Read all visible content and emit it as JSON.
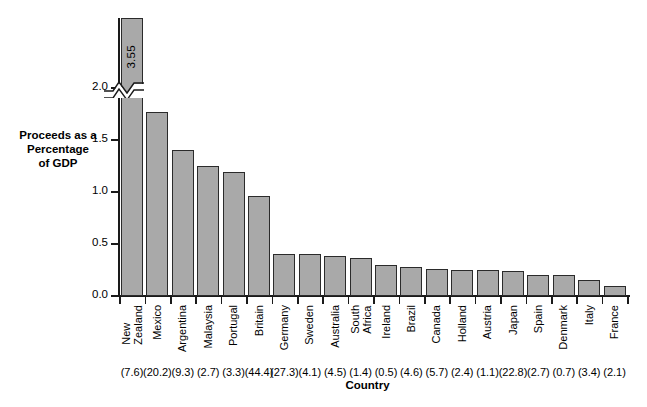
{
  "chart_data": {
    "type": "bar",
    "title": "",
    "xlabel": "Country",
    "ylabel": "Proceeds as a Percentage of GDP",
    "ylabel_lines": [
      "Proceeds as a",
      "Percentage",
      "of GDP"
    ],
    "ylim": [
      0.0,
      2.0
    ],
    "y_axis_break": true,
    "y_axis_break_note": "axis broken just below 2.0; first bar extends to 3.55",
    "yticks": [
      0.0,
      0.5,
      1.0,
      1.5,
      2.0
    ],
    "ytick_labels": [
      "0.0",
      "0.5",
      "1.0",
      "1.5",
      "2.0"
    ],
    "grid": false,
    "legend": "none",
    "bar_color": "#a9a9a9",
    "bar_edge_color": "#2b2b2b",
    "categories": [
      "New Zealand",
      "Mexico",
      "Argentina",
      "Malaysia",
      "Portugal",
      "Britain",
      "Germany",
      "Sweden",
      "Australia",
      "South Africa",
      "Ireland",
      "Brazil",
      "Canada",
      "Holland",
      "Austria",
      "Japan",
      "Spain",
      "Denmark",
      "Italy",
      "France"
    ],
    "category_lines": [
      [
        "New",
        "Zealand"
      ],
      [
        "Mexico"
      ],
      [
        "Argentina"
      ],
      [
        "Malaysia"
      ],
      [
        "Portugal"
      ],
      [
        "Britain"
      ],
      [
        "Germany"
      ],
      [
        "Sweden"
      ],
      [
        "Australia"
      ],
      [
        "South",
        "Africa"
      ],
      [
        "Ireland"
      ],
      [
        "Brazil"
      ],
      [
        "Canada"
      ],
      [
        "Holland"
      ],
      [
        "Austria"
      ],
      [
        "Japan"
      ],
      [
        "Spain"
      ],
      [
        "Denmark"
      ],
      [
        "Italy"
      ],
      [
        "France"
      ]
    ],
    "values": [
      3.55,
      1.77,
      1.4,
      1.25,
      1.19,
      0.96,
      0.4,
      0.4,
      0.38,
      0.37,
      0.3,
      0.28,
      0.26,
      0.25,
      0.25,
      0.24,
      0.2,
      0.2,
      0.15,
      0.1
    ],
    "data_labels": [
      "3.55"
    ],
    "secondary_values": [
      "(7.6)",
      "(20.2)",
      "(9.3)",
      "(2.7)",
      "(3.3)",
      "(44.4)",
      "(27.3)",
      "(4.1)",
      "(4.5)",
      "(1.4)",
      "(0.5)",
      "(4.6)",
      "(5.7)",
      "(2.4)",
      "(1.1)",
      "(22.8)",
      "(2.7)",
      "(0.7)",
      "(3.4)",
      "(2.1)"
    ]
  }
}
